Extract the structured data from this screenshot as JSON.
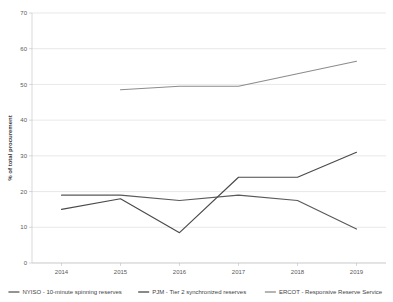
{
  "chart_data": {
    "type": "line",
    "title": "",
    "xlabel": "",
    "ylabel": "% of total procurement",
    "categories": [
      "2014",
      "2015",
      "2016",
      "2017",
      "2018",
      "2019"
    ],
    "x": [
      2014,
      2015,
      2016,
      2017,
      2018,
      2019
    ],
    "ylim": [
      0,
      70
    ],
    "yticks": [
      0,
      10,
      20,
      30,
      40,
      50,
      60,
      70
    ],
    "ytick_labels": [
      "0",
      "10",
      "20",
      "30",
      "40",
      "50",
      "60",
      "70"
    ],
    "grid": true,
    "legend_position": "bottom",
    "series": [
      {
        "name": "NYISO - 10-minute spinning reserves",
        "color": "#595959",
        "values": [
          19,
          19,
          17.5,
          19,
          17.5,
          9.5
        ]
      },
      {
        "name": "PJM - Tier 2 synchronized reserves",
        "color": "#4a4a4a",
        "values": [
          15,
          18,
          8.5,
          24,
          24,
          31
        ]
      },
      {
        "name": "ERCOT - Responsive Reserve Service",
        "color": "#8c8c8c",
        "values": [
          null,
          48.5,
          49.5,
          49.5,
          53,
          56.5
        ]
      }
    ]
  },
  "legend": {
    "items": [
      {
        "label": "NYISO - 10-minute spinning reserves",
        "color": "#595959"
      },
      {
        "label": "PJM - Tier 2 synchronized reserves",
        "color": "#4a4a4a"
      },
      {
        "label": "ERCOT - Responsive Reserve Service",
        "color": "#8c8c8c"
      }
    ]
  },
  "colors": {
    "gridline": "#d9d9d9",
    "axis": "#bfbfbf",
    "text": "#3f3f3f",
    "background": "#ffffff"
  }
}
